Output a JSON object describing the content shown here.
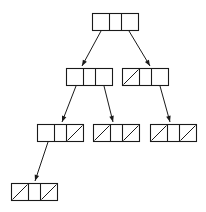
{
  "diagram": {
    "kind": "tree-node-pointer-diagram",
    "title": "",
    "canvas": {
      "width": 206,
      "height": 212,
      "background": "#ffffff"
    },
    "style": {
      "stroke_color": "#1a1a1a",
      "node_fill": "none",
      "node_stroke_width": 1.1,
      "edge_stroke_width": 1
    },
    "legend": {
      "slash_meaning": "null-pointer-slash",
      "empty_cell_meaning": "child-pointer-cell"
    },
    "levels": [
      {
        "level": 1,
        "node_ids": [
          "root"
        ]
      },
      {
        "level": 2,
        "node_ids": [
          "n2a",
          "n2b"
        ]
      },
      {
        "level": 3,
        "node_ids": [
          "n3a",
          "n3b",
          "n3c"
        ]
      },
      {
        "level": 4,
        "node_ids": [
          "n4a"
        ]
      }
    ],
    "nodes": [
      {
        "id": "root",
        "label": "root-node",
        "x": 92,
        "y": 13,
        "w": 46,
        "h": 17,
        "cells": 3,
        "cell_widths": [
          17,
          12,
          17
        ],
        "slashes": [
          false,
          false,
          false
        ]
      },
      {
        "id": "n2a",
        "label": "level2-left-node",
        "x": 66,
        "y": 68,
        "w": 46,
        "h": 17,
        "cells": 3,
        "cell_widths": [
          17,
          12,
          17
        ],
        "slashes": [
          false,
          false,
          false
        ]
      },
      {
        "id": "n2b",
        "label": "level2-right-node",
        "x": 122,
        "y": 68,
        "w": 46,
        "h": 17,
        "cells": 3,
        "cell_widths": [
          17,
          12,
          17
        ],
        "slashes": [
          true,
          false,
          false
        ]
      },
      {
        "id": "n3a",
        "label": "level3-left-node",
        "x": 37,
        "y": 124,
        "w": 46,
        "h": 17,
        "cells": 3,
        "cell_widths": [
          17,
          12,
          17
        ],
        "slashes": [
          false,
          false,
          true
        ]
      },
      {
        "id": "n3b",
        "label": "level3-middle-node",
        "x": 93,
        "y": 124,
        "w": 46,
        "h": 17,
        "cells": 3,
        "cell_widths": [
          17,
          12,
          17
        ],
        "slashes": [
          true,
          false,
          true
        ]
      },
      {
        "id": "n3c",
        "label": "level3-right-node",
        "x": 150,
        "y": 124,
        "w": 46,
        "h": 17,
        "cells": 3,
        "cell_widths": [
          17,
          12,
          17
        ],
        "slashes": [
          true,
          false,
          true
        ]
      },
      {
        "id": "n4a",
        "label": "level4-leaf-node",
        "x": 11,
        "y": 183,
        "w": 46,
        "h": 17,
        "cells": 3,
        "cell_widths": [
          17,
          12,
          17
        ],
        "slashes": [
          true,
          false,
          true
        ]
      }
    ],
    "edges": [
      {
        "id": "e1",
        "label": "root-to-level2-left",
        "from": "root",
        "to": "n2a",
        "x1": 101,
        "y1": 31,
        "x2": 82,
        "y2": 66
      },
      {
        "id": "e2",
        "label": "root-to-level2-right",
        "from": "root",
        "to": "n2b",
        "x1": 129,
        "y1": 31,
        "x2": 150,
        "y2": 66
      },
      {
        "id": "e3",
        "label": "level2left-to-level3left",
        "from": "n2a",
        "to": "n3a",
        "x1": 76,
        "y1": 86,
        "x2": 62,
        "y2": 122
      },
      {
        "id": "e4",
        "label": "level2left-to-level3middle",
        "from": "n2a",
        "to": "n3b",
        "x1": 104,
        "y1": 86,
        "x2": 113,
        "y2": 122
      },
      {
        "id": "e5",
        "label": "level2right-to-level3right",
        "from": "n2b",
        "to": "n3c",
        "x1": 160,
        "y1": 86,
        "x2": 170,
        "y2": 122
      },
      {
        "id": "e6",
        "label": "level3left-to-level4leaf",
        "from": "n3a",
        "to": "n4a",
        "x1": 48,
        "y1": 142,
        "x2": 35,
        "y2": 181
      }
    ]
  }
}
